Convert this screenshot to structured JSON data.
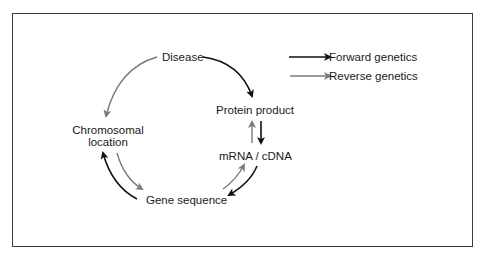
{
  "diagram": {
    "nodes": {
      "disease": "Disease",
      "protein_product": "Protein product",
      "mrna_cdna": "mRNA / cDNA",
      "gene_sequence": "Gene sequence",
      "chromosomal_location_line1": "Chromosomal",
      "chromosomal_location_line2": "location"
    },
    "legend": {
      "forward": {
        "label": "Forward genetics",
        "color": "#111111"
      },
      "reverse": {
        "label": "Reverse genetics",
        "color": "#7a7a7a"
      }
    },
    "edges": [
      {
        "from": "Disease",
        "to": "Protein product",
        "type": "forward"
      },
      {
        "from": "Protein product",
        "to": "mRNA / cDNA",
        "type": "forward"
      },
      {
        "from": "mRNA / cDNA",
        "to": "Gene sequence",
        "type": "forward"
      },
      {
        "from": "Gene sequence",
        "to": "Chromosomal location",
        "type": "forward"
      },
      {
        "from": "Disease",
        "to": "Chromosomal location",
        "type": "reverse"
      },
      {
        "from": "Chromosomal location",
        "to": "Gene sequence",
        "type": "reverse"
      },
      {
        "from": "Gene sequence",
        "to": "mRNA / cDNA",
        "type": "reverse"
      },
      {
        "from": "mRNA / cDNA",
        "to": "Protein product",
        "type": "reverse"
      }
    ]
  }
}
